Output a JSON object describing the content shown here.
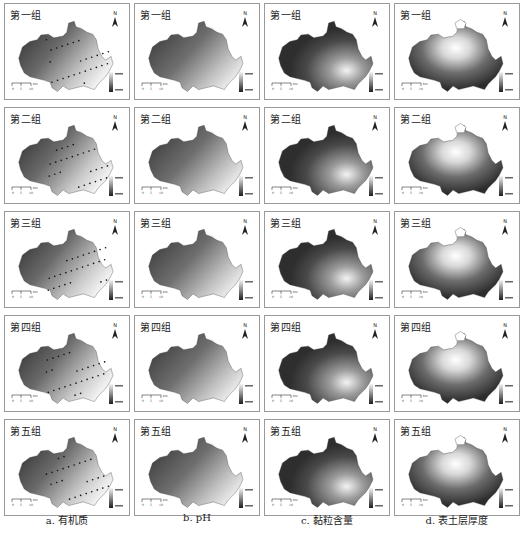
{
  "figure": {
    "row_labels": [
      "第一组",
      "第二组",
      "第三组",
      "第四组",
      "第五组"
    ],
    "columns": [
      {
        "id": "a",
        "caption": "a. 有机质",
        "style": "dark-west-light-southeast",
        "has_points": true
      },
      {
        "id": "b",
        "caption": "b. pH",
        "style": "dark-west-light-southeast",
        "has_points": false
      },
      {
        "id": "c",
        "caption": "c. 黏粒含量",
        "style": "patchy-light-center-southeast",
        "has_points": false
      },
      {
        "id": "d",
        "caption": "d. 表土层厚度",
        "style": "light-center-north",
        "has_points": false
      }
    ],
    "north_label": "N",
    "scale_label": "km",
    "colors": {
      "dark": "#2e2e2e",
      "mid": "#7a7a7a",
      "light": "#e8e8e8",
      "border": "#9a9a9a"
    }
  }
}
